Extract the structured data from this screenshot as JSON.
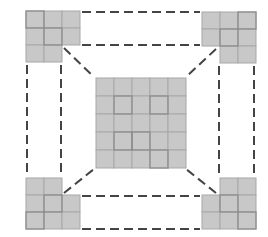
{
  "diagram": {
    "title": "",
    "colors": {
      "cell_fill": "#c8c8c8",
      "cell_stroke": "#a8a8a8",
      "highlight_stroke": "#8c8c8c",
      "dash": "#444444",
      "background": "#ffffff"
    },
    "cell_size": 18,
    "center_grid": {
      "x": 96,
      "y": 78,
      "rows": 5,
      "cols": 5
    },
    "corner_blocks": [
      {
        "name": "top-left",
        "cells": [
          [
            26,
            11
          ],
          [
            44,
            11
          ],
          [
            62,
            11
          ],
          [
            26,
            28
          ],
          [
            44,
            28
          ],
          [
            62,
            28
          ],
          [
            26,
            45
          ],
          [
            44,
            45
          ]
        ]
      },
      {
        "name": "top-right",
        "cells": [
          [
            202,
            12
          ],
          [
            220,
            12
          ],
          [
            238,
            12
          ],
          [
            202,
            29
          ],
          [
            220,
            29
          ],
          [
            238,
            29
          ],
          [
            220,
            46
          ],
          [
            238,
            46
          ]
        ]
      },
      {
        "name": "bottom-left",
        "cells": [
          [
            26,
            178
          ],
          [
            44,
            178
          ],
          [
            26,
            195
          ],
          [
            44,
            195
          ],
          [
            62,
            195
          ],
          [
            26,
            212
          ],
          [
            44,
            212
          ],
          [
            62,
            212
          ]
        ]
      },
      {
        "name": "bottom-right",
        "cells": [
          [
            220,
            178
          ],
          [
            238,
            178
          ],
          [
            202,
            195
          ],
          [
            220,
            195
          ],
          [
            238,
            195
          ],
          [
            202,
            212
          ],
          [
            220,
            212
          ],
          [
            238,
            212
          ]
        ]
      }
    ],
    "dashed_lines": [
      {
        "name": "top-upper",
        "x1": 82,
        "y1": 12,
        "x2": 200,
        "y2": 12
      },
      {
        "name": "top-lower",
        "x1": 82,
        "y1": 45,
        "x2": 200,
        "y2": 45
      },
      {
        "name": "bottom-upper",
        "x1": 82,
        "y1": 196,
        "x2": 200,
        "y2": 196
      },
      {
        "name": "bottom-lower",
        "x1": 82,
        "y1": 229,
        "x2": 200,
        "y2": 229
      },
      {
        "name": "left-outer",
        "x1": 27,
        "y1": 65,
        "x2": 27,
        "y2": 176
      },
      {
        "name": "left-inner",
        "x1": 61,
        "y1": 65,
        "x2": 61,
        "y2": 176
      },
      {
        "name": "right-inner",
        "x1": 219,
        "y1": 66,
        "x2": 219,
        "y2": 176
      },
      {
        "name": "right-outer",
        "x1": 254,
        "y1": 66,
        "x2": 254,
        "y2": 176
      },
      {
        "name": "diag-top-left",
        "x1": 64,
        "y1": 48,
        "x2": 94,
        "y2": 77
      },
      {
        "name": "diag-top-right",
        "x1": 216,
        "y1": 49,
        "x2": 186,
        "y2": 77
      },
      {
        "name": "diag-bottom-left",
        "x1": 64,
        "y1": 193,
        "x2": 94,
        "y2": 169
      },
      {
        "name": "diag-bottom-right",
        "x1": 216,
        "y1": 193,
        "x2": 186,
        "y2": 169
      }
    ]
  }
}
